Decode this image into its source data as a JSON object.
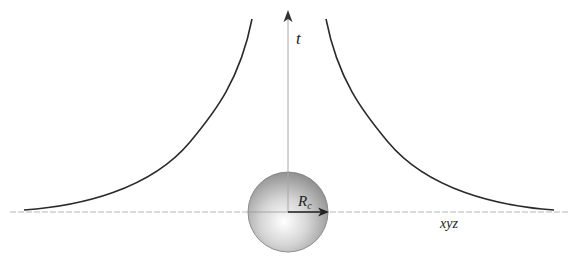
{
  "diagram": {
    "labels": {
      "vertical_axis": "t",
      "horizontal_axis": "xyz",
      "radius": "R",
      "radius_subscript": "c"
    },
    "colors": {
      "axis": "#b0b0b0",
      "curve": "#2a2a2a",
      "sphere_light": "#ffffff",
      "sphere_dark": "#8a8a8a",
      "arrow": "#222222"
    },
    "elements": [
      "vertical time axis with arrow",
      "horizontal spatial axis (dashed)",
      "shaded sphere of radius R_c centred at origin",
      "radius arrow",
      "two symmetric hyperbolic-like curves diverging toward t axis"
    ]
  }
}
